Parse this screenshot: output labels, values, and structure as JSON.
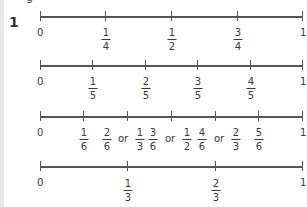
{
  "question_number": "1",
  "top_fragment": "g",
  "number_lines": [
    {
      "id": "quarters",
      "start_label": "0",
      "end_label": "1",
      "marks": [
        {
          "num": "1",
          "den": "4"
        },
        {
          "num": "1",
          "den": "2"
        },
        {
          "num": "3",
          "den": "4"
        }
      ]
    },
    {
      "id": "fifths",
      "start_label": "0",
      "end_label": "1",
      "marks": [
        {
          "num": "1",
          "den": "5"
        },
        {
          "num": "2",
          "den": "5"
        },
        {
          "num": "3",
          "den": "5"
        },
        {
          "num": "4",
          "den": "5"
        }
      ]
    },
    {
      "id": "sixths",
      "start_label": "0",
      "end_label": "1",
      "marks": [
        {
          "num": "1",
          "den": "6"
        },
        {
          "num": "2",
          "den": "6",
          "alt_num": "1",
          "alt_den": "3"
        },
        {
          "num": "3",
          "den": "6",
          "alt_num": "1",
          "alt_den": "2"
        },
        {
          "num": "4",
          "den": "6",
          "alt_num": "2",
          "alt_den": "3"
        },
        {
          "num": "5",
          "den": "6"
        }
      ],
      "or_word": "or"
    },
    {
      "id": "thirds",
      "start_label": "0",
      "end_label": "1",
      "marks": [
        {
          "num": "1",
          "den": "3"
        },
        {
          "num": "2",
          "den": "3"
        }
      ]
    }
  ]
}
